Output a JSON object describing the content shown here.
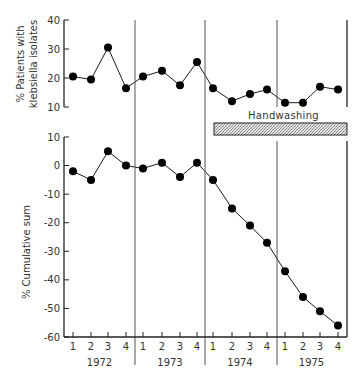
{
  "chart_data": [
    {
      "type": "line",
      "panel": "top",
      "ylabel": "% Patients with klebsiella isolates",
      "ylabel_lines": [
        "% Patients with",
        "klebsiella isolates"
      ],
      "ylim": [
        10,
        40
      ],
      "yticks": [
        10,
        20,
        30,
        40
      ],
      "years": [
        "1972",
        "1973",
        "1974",
        "1975"
      ],
      "quarters": [
        "1",
        "2",
        "3",
        "4"
      ],
      "categories": [
        "1972 Q1",
        "1972 Q2",
        "1972 Q3",
        "1972 Q4",
        "1973 Q1",
        "1973 Q2",
        "1973 Q3",
        "1973 Q4",
        "1974 Q1",
        "1974 Q2",
        "1974 Q3",
        "1974 Q4",
        "1975 Q1",
        "1975 Q2",
        "1975 Q3",
        "1975 Q4"
      ],
      "values": [
        20.5,
        19.5,
        30.5,
        16.5,
        20.5,
        22.5,
        17.5,
        25.5,
        16.5,
        12,
        14.5,
        16,
        11.5,
        11.5,
        17,
        16
      ],
      "grid": false
    },
    {
      "type": "line",
      "panel": "bottom",
      "ylabel": "% Cumulative sum",
      "ylim": [
        -60,
        10
      ],
      "yticks": [
        10,
        0,
        -10,
        -20,
        -30,
        -40,
        -50,
        -60
      ],
      "xlabel_years": [
        "1972",
        "1973",
        "1974",
        "1975"
      ],
      "quarters": [
        "1",
        "2",
        "3",
        "4"
      ],
      "categories": [
        "1972 Q1",
        "1972 Q2",
        "1972 Q3",
        "1972 Q4",
        "1973 Q1",
        "1973 Q2",
        "1973 Q3",
        "1973 Q4",
        "1974 Q1",
        "1974 Q2",
        "1974 Q3",
        "1974 Q4",
        "1975 Q1",
        "1975 Q2",
        "1975 Q3",
        "1975 Q4"
      ],
      "values": [
        -2,
        -5,
        5,
        0,
        -1,
        1,
        -4,
        1,
        -5,
        -15,
        -21,
        -27,
        -37,
        -46,
        -51,
        -56
      ],
      "grid": false
    }
  ],
  "annotation": {
    "label": "Handwashing",
    "start": "1974 Q1",
    "end": "1975 Q4"
  },
  "labels": {
    "top_ylabel_1": "% Patients with",
    "top_ylabel_2": "klebsiella isolates",
    "bottom_ylabel": "% Cumulative sum",
    "handwashing": "Handwashing"
  },
  "colors": {
    "line": "#1a1a1a",
    "marker": "#000000",
    "axis": "#222222",
    "divider": "#555555",
    "bar_fill": "#c8c8c8"
  }
}
